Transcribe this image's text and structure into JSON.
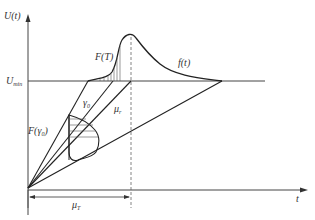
{
  "diagram": {
    "type": "stress-strength interference / voltage response diagram",
    "axes": {
      "y_label": "U(t)",
      "x_label": "t"
    },
    "labels": {
      "u_min": "U",
      "u_min_sub": "min",
      "f_T": "F(T)",
      "f_t": "f(t)",
      "gamma0": "γ",
      "gamma0_sub": "0",
      "mu_r": "μ",
      "mu_r_sub": "r",
      "F_gamma0_pre": "F(γ",
      "F_gamma0_sub": "0",
      "F_gamma0_post": ")",
      "mu_T": "μ",
      "mu_T_sub": "T"
    },
    "colors": {
      "line": "#222222",
      "axis": "#444444",
      "dashed": "#666666"
    }
  }
}
